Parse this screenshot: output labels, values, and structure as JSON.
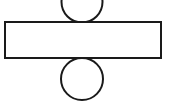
{
  "canvas": {
    "width": 169,
    "height": 101,
    "background_color": "#ffffff"
  },
  "figure": {
    "name": "division-sign-diagram",
    "stroke_color": "#1a1a1a",
    "fill_color": "#ffffff",
    "stroke_width": 2
  },
  "shapes": {
    "bar": {
      "label": "horizontal-bar",
      "type": "rectangle",
      "x": 5,
      "y": 22,
      "width": 156,
      "height": 36,
      "stroke_color": "#1a1a1a",
      "fill_color": "#ffffff",
      "stroke_width": 2
    },
    "top_circle": {
      "label": "top-circle",
      "type": "circle",
      "cx": 82,
      "cy": 2,
      "r": 20.5,
      "stroke_color": "#1a1a1a",
      "fill_color": "#ffffff",
      "stroke_width": 2,
      "clipped": "top"
    },
    "bottom_circle": {
      "label": "bottom-circle",
      "type": "circle",
      "cx": 82,
      "cy": 79,
      "r": 21,
      "stroke_color": "#1a1a1a",
      "fill_color": "#ffffff",
      "stroke_width": 2,
      "clipped": "bottom"
    }
  }
}
